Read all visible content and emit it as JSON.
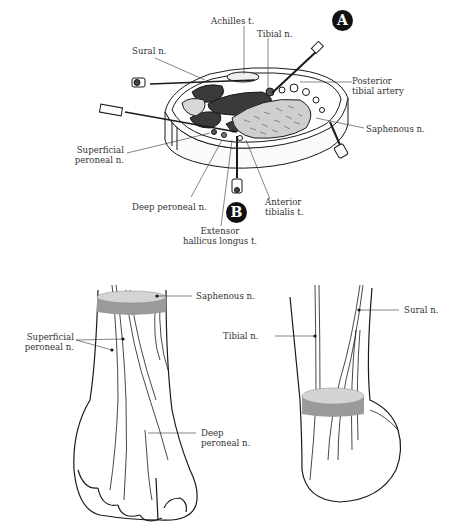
{
  "figure": {
    "panels": [
      {
        "id": "cross-section",
        "labels": {
          "achilles": "Achilles t.",
          "tibial": "Tibial n.",
          "sural": "Sural n.",
          "posterior_tibial_artery_1": "Posterior",
          "posterior_tibial_artery_2": "tibial artery",
          "saphenous": "Saphenous n.",
          "superficial_peroneal_1": "Superficial",
          "superficial_peroneal_2": "peroneal n.",
          "deep_peroneal": "Deep peroneal n.",
          "anterior_tibialis_1": "Anterior",
          "anterior_tibialis_2": "tibialis t.",
          "ehl_1": "Extensor",
          "ehl_2": "hallicus longus t."
        },
        "markers": {
          "a": "A",
          "b": "B"
        }
      },
      {
        "id": "anterior-view",
        "labels": {
          "saphenous": "Saphenous n.",
          "superficial_peroneal_1": "Superficial",
          "superficial_peroneal_2": "peroneal n.",
          "deep_peroneal_1": "Deep",
          "deep_peroneal_2": "peroneal n."
        }
      },
      {
        "id": "posterior-view",
        "labels": {
          "tibial": "Tibial n.",
          "sural": "Sural n."
        }
      }
    ],
    "colors": {
      "line": "#1a1a1a",
      "band_top": "#d4d4d4",
      "band_side": "#9a9a9a",
      "muscle_dark": "#3a3a3a",
      "badge": "#111111"
    }
  }
}
